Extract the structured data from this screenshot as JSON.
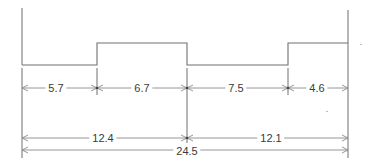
{
  "diagram": {
    "type": "stepped profile with dimension lines",
    "colors": {
      "line": "#6e6e6e",
      "text": "#3a3a3a",
      "background": "#ffffff"
    },
    "segments": [
      {
        "id": "seg1",
        "label": "5.7",
        "level": "low"
      },
      {
        "id": "seg2",
        "label": "6.7",
        "level": "high"
      },
      {
        "id": "seg3",
        "label": "7.5",
        "level": "low"
      },
      {
        "id": "seg4",
        "label": "4.6",
        "level": "high"
      }
    ],
    "subtotals": [
      {
        "id": "left-half",
        "label": "12.4"
      },
      {
        "id": "right-half",
        "label": "12.1"
      }
    ],
    "total": {
      "label": "24.5"
    }
  }
}
